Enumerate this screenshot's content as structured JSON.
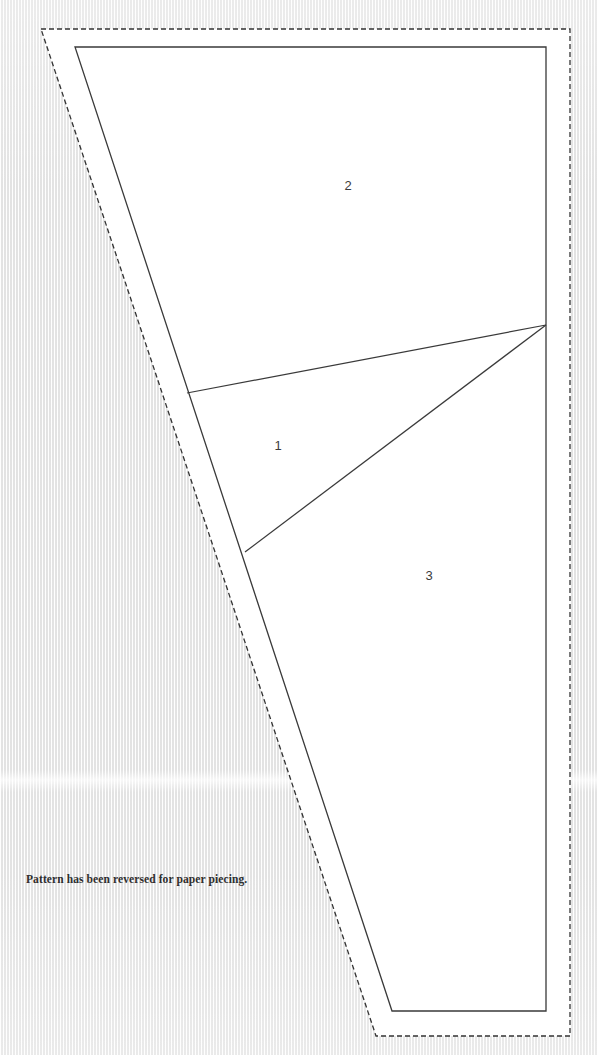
{
  "document": {
    "title": "Paper Piecing Pattern",
    "note": "Pattern has been reversed for paper piecing.",
    "background_color": "#f1f1f1",
    "paper_color": "#ffffff",
    "line_color": "#3a3a3a",
    "text_color": "#2e2e2e"
  },
  "pattern": {
    "cut_line": {
      "name": "seam-allowance-dashed-outline",
      "style": "dashed",
      "dash": "5 3",
      "stroke_width": 1.3,
      "points": "41,29 570,29 570,1036 376,1036"
    },
    "sewing_line": {
      "name": "pattern-solid-outline",
      "style": "solid",
      "stroke_width": 1.3,
      "points": "75,47 546,47 546,1011 392,1011"
    },
    "internal_seams": [
      {
        "name": "seam-1-2",
        "from": "187,393",
        "to": "546,325"
      },
      {
        "name": "seam-1-3",
        "from": "245,552",
        "to": "546,325"
      }
    ],
    "pieces": [
      {
        "label": "2",
        "x": 348,
        "y": 187
      },
      {
        "label": "1",
        "x": 278,
        "y": 447
      },
      {
        "label": "3",
        "x": 429,
        "y": 577
      }
    ]
  }
}
